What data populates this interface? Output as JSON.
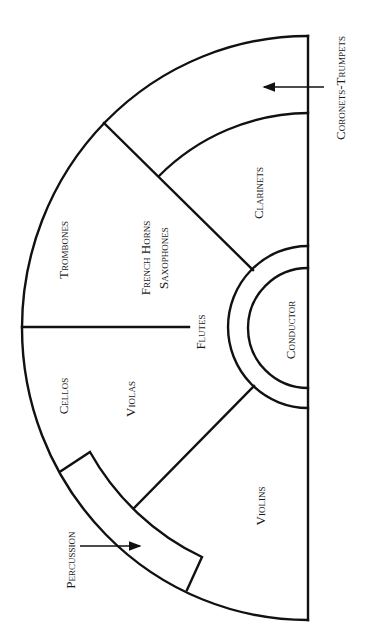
{
  "diagram": {
    "orientation": "rotated 90 degrees; conductor on right edge, audience side",
    "line_color": "#111111",
    "background": "#ffffff",
    "sections": {
      "coronets_trumpets": "Coronets-Trumpets",
      "clarinets": "Clarinets",
      "trombones": "Trombones",
      "french_horns": "French Horns",
      "saxophones": "Saxophones",
      "flutes": "Flutes",
      "conductor": "Conductor",
      "cellos": "Cellos",
      "violas": "Violas",
      "violins": "Violins",
      "percussion": "Percussion"
    },
    "callouts": [
      {
        "label": "Coronets-Trumpets",
        "points_to": "outer upper-right region"
      },
      {
        "label": "Percussion",
        "points_to": "curved box along outer lower arc"
      }
    ]
  }
}
